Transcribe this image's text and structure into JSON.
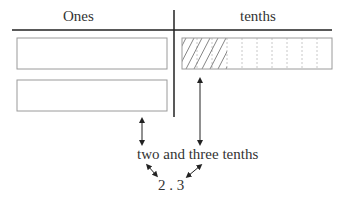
{
  "headers": {
    "ones": "Ones",
    "tenths": "tenths"
  },
  "labels": {
    "words": "two and three tenths",
    "number": "2 . 3"
  },
  "model": {
    "ones_blocks": 2,
    "tenths_total": 10,
    "tenths_shaded": 3
  },
  "colors": {
    "line": "#222222",
    "box": "#9a9a9a",
    "hatch": "#666666",
    "grid": "#c8c8c8"
  }
}
